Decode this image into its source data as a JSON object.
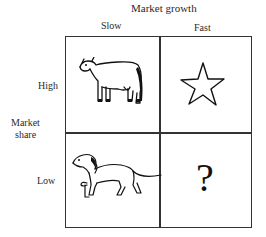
{
  "diagram": {
    "type": "2x2 matrix",
    "x_axis": {
      "title": "Market growth",
      "columns": [
        "Slow",
        "Fast"
      ]
    },
    "y_axis": {
      "title_line1": "Market",
      "title_line2": "share",
      "rows": [
        "High",
        "Low"
      ]
    },
    "cells": [
      {
        "row": "High",
        "col": "Slow",
        "icon": "cow-icon"
      },
      {
        "row": "High",
        "col": "Fast",
        "icon": "star-icon"
      },
      {
        "row": "Low",
        "col": "Slow",
        "icon": "dog-icon"
      },
      {
        "row": "Low",
        "col": "Fast",
        "icon": "question-mark-icon",
        "text": "?"
      }
    ]
  }
}
